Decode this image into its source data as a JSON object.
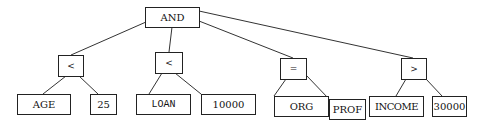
{
  "diagram": {
    "type": "expression-tree",
    "root": {
      "id": "and",
      "label": "AND",
      "children": [
        "lt1",
        "lt2",
        "eq",
        "gt"
      ]
    },
    "operators": [
      {
        "id": "lt1",
        "label": "<",
        "left": "age",
        "right": "v25"
      },
      {
        "id": "lt2",
        "label": "<",
        "left": "loan",
        "right": "v10000"
      },
      {
        "id": "eq",
        "label": "=",
        "left": "org",
        "right": "prof"
      },
      {
        "id": "gt",
        "label": ">",
        "left": "income",
        "right": "v30000"
      }
    ],
    "leaves": {
      "age": "AGE",
      "v25": "25",
      "loan": "LOAN",
      "v10000": "10000",
      "org": "ORG",
      "prof": "PROF",
      "income": "INCOME",
      "v30000": "30000"
    },
    "colors": {
      "line": "#333333",
      "border": "#222222",
      "background": "#ffffff"
    }
  }
}
